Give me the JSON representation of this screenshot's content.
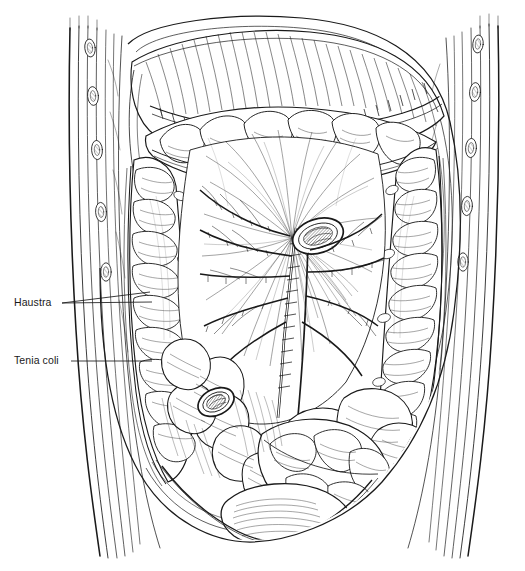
{
  "figure": {
    "style": "pen-and-ink line engraving, black linework on white",
    "background_color": "#ffffff",
    "ink_color": "#1a1a1a",
    "width": 525,
    "height": 571
  },
  "annotations": [
    {
      "id": "haustra",
      "label": "Haustra",
      "text_x": 14,
      "text_y": 297,
      "leader_kind": "forked",
      "leader_origin": {
        "x": 62,
        "y": 303
      },
      "leader_targets": [
        {
          "x": 152,
          "y": 302
        },
        {
          "x": 150,
          "y": 292
        }
      ]
    },
    {
      "id": "tenia-coli",
      "label": "Tenia coli",
      "text_x": 14,
      "text_y": 355,
      "leader_kind": "single",
      "leader_origin": {
        "x": 71,
        "y": 361
      },
      "leader_targets": [
        {
          "x": 152,
          "y": 361
        }
      ]
    }
  ],
  "structures": [
    {
      "name": "abdominal-wall-left",
      "description": "cut layered left abdominal wall with vessel cross-sections"
    },
    {
      "name": "abdominal-wall-right",
      "description": "cut layered right abdominal wall with vessel cross-sections"
    },
    {
      "name": "greater-omentum",
      "description": "reflected greater omentum draped over the transverse colon"
    },
    {
      "name": "transverse-colon",
      "description": "transverse colon with haustra crossing the upper abdomen"
    },
    {
      "name": "ascending-colon",
      "description": "ascending colon on the left of the image"
    },
    {
      "name": "descending-colon",
      "description": "descending colon on the right of the image"
    },
    {
      "name": "mesentery",
      "description": "fan-shaped mesentery with vascular arcades and cut root"
    },
    {
      "name": "small-intestine",
      "description": "coiled jejunal and ileal loops in the lower abdomen"
    },
    {
      "name": "sigmoid-colon",
      "description": "sigmoid colon looping into the pelvis"
    },
    {
      "name": "urinary-bladder",
      "description": "urinary bladder at the pelvic floor"
    },
    {
      "name": "mesenteric-vessels",
      "description": "superior mesenteric artery and vein at the cut mesenteric root"
    }
  ]
}
